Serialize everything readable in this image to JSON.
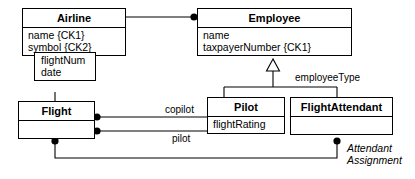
{
  "diagram": {
    "type": "uml-class-diagram",
    "background_color": "#ffffff",
    "line_color": "#000000",
    "text_color": "#000000"
  },
  "classes": {
    "airline": {
      "name": "Airline",
      "attributes": [
        "name {CK1}",
        "symbol {CK2}"
      ]
    },
    "employee": {
      "name": "Employee",
      "attributes": [
        "name",
        "taxpayerNumber {CK1}"
      ]
    },
    "flight": {
      "name": "Flight",
      "attributes": []
    },
    "pilot": {
      "name": "Pilot",
      "attributes": [
        "flightRating"
      ]
    },
    "flight_attendant": {
      "name": "FlightAttendant",
      "attributes": []
    }
  },
  "floating_box": {
    "lines": [
      "flightNum",
      "date"
    ]
  },
  "labels": {
    "employee_type": "employeeType",
    "copilot": "copilot",
    "pilot": "pilot",
    "attendant_assignment_line1": "Attendant",
    "attendant_assignment_line2": "Assignment"
  },
  "relationships": [
    {
      "name": "airline-employee-association",
      "from": "Airline",
      "to": "Employee",
      "from_marker": "none",
      "to_marker": "filled-dot",
      "label": ""
    },
    {
      "name": "employee-generalization",
      "from": [
        "Pilot",
        "FlightAttendant"
      ],
      "to": "Employee",
      "marker": "hollow-triangle",
      "discriminator": "employeeType"
    },
    {
      "name": "flight-pilot-copilot",
      "from": "Flight",
      "to": "Pilot",
      "from_marker": "filled-dot",
      "label": "copilot"
    },
    {
      "name": "flight-pilot-pilot",
      "from": "Flight",
      "to": "Pilot",
      "from_marker": "filled-dot",
      "label": "pilot"
    },
    {
      "name": "flight-flightattendant-assignment",
      "from": "Flight",
      "to": "FlightAttendant",
      "from_marker": "filled-dot",
      "to_marker": "filled-dot",
      "label": "Attendant Assignment"
    },
    {
      "name": "flight-attribute-box",
      "from": "Flight",
      "to": "flightNum/date box",
      "marker": "none",
      "label": ""
    }
  ]
}
